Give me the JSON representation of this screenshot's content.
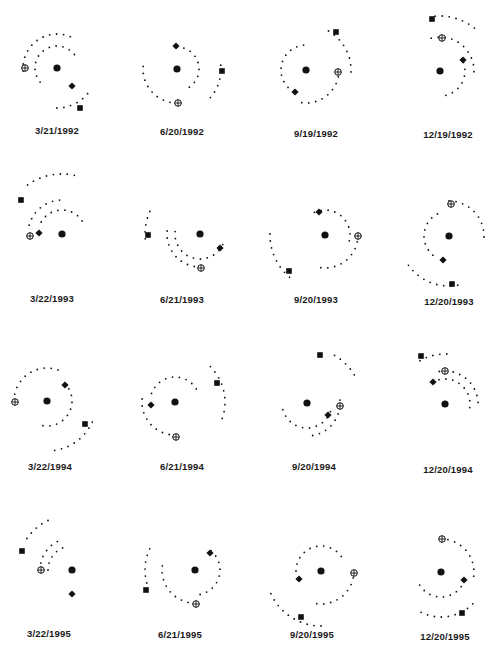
{
  "figure": {
    "type": "orbital-positions-grid",
    "rows": 4,
    "columns": 4,
    "colors": {
      "ink": "#111111",
      "background": "#ffffff"
    },
    "marker_legend": {
      "center": "filled-circle",
      "planet_a": "diamond",
      "planet_b": "circled-plus",
      "planet_c": "square"
    },
    "panels": [
      {
        "label": "3/21/1992",
        "label_pos": [
          57,
          131
        ],
        "center": [
          57,
          68
        ],
        "arcs": [
          {
            "cx": 57,
            "cy": 68,
            "r": 22,
            "a0": 140,
            "a1": 330
          },
          {
            "cx": 57,
            "cy": 68,
            "r": 34,
            "a0": 175,
            "a1": 300
          },
          {
            "cx": 57,
            "cy": 68,
            "r": 40,
            "a0": 40,
            "a1": 100
          }
        ],
        "markers": [
          {
            "type": "diamond",
            "x": 72,
            "y": 86
          },
          {
            "type": "circled-plus",
            "x": 25,
            "y": 68
          },
          {
            "type": "square",
            "x": 80,
            "y": 108
          }
        ]
      },
      {
        "label": "6/20/1992",
        "label_pos": [
          182,
          132
        ],
        "center": [
          177,
          69
        ],
        "arcs": [
          {
            "cx": 177,
            "cy": 69,
            "r": 22,
            "a0": -90,
            "a1": 60
          },
          {
            "cx": 177,
            "cy": 69,
            "r": 34,
            "a0": 90,
            "a1": 190
          },
          {
            "cx": 177,
            "cy": 69,
            "r": 44,
            "a0": -5,
            "a1": 45
          }
        ],
        "markers": [
          {
            "type": "diamond",
            "x": 176,
            "y": 46
          },
          {
            "type": "circled-plus",
            "x": 178,
            "y": 103
          },
          {
            "type": "square",
            "x": 222,
            "y": 71
          }
        ]
      },
      {
        "label": "9/19/1992",
        "label_pos": [
          316,
          134
        ],
        "center": [
          306,
          70
        ],
        "arcs": [
          {
            "cx": 306,
            "cy": 70,
            "r": 25,
            "a0": 120,
            "a1": 270
          },
          {
            "cx": 306,
            "cy": 70,
            "r": 33,
            "a0": 0,
            "a1": 105
          },
          {
            "cx": 306,
            "cy": 70,
            "r": 45,
            "a0": -60,
            "a1": 5
          }
        ],
        "markers": [
          {
            "type": "diamond",
            "x": 295,
            "y": 92
          },
          {
            "type": "circled-plus",
            "x": 338,
            "y": 72
          },
          {
            "type": "square",
            "x": 336,
            "y": 32
          }
        ]
      },
      {
        "label": "12/19/1992",
        "label_pos": [
          448,
          135
        ],
        "center": [
          440,
          71
        ],
        "arcs": [
          {
            "cx": 440,
            "cy": 71,
            "r": 25,
            "a0": -20,
            "a1": 90
          },
          {
            "cx": 440,
            "cy": 71,
            "r": 34,
            "a0": -105,
            "a1": 10
          },
          {
            "cx": 440,
            "cy": 71,
            "r": 55,
            "a0": -95,
            "a1": -45
          }
        ],
        "markers": [
          {
            "type": "diamond",
            "x": 463,
            "y": 60
          },
          {
            "type": "circled-plus",
            "x": 442,
            "y": 38
          },
          {
            "type": "square",
            "x": 432,
            "y": 19
          }
        ]
      },
      {
        "label": "3/22/1993",
        "label_pos": [
          52,
          299
        ],
        "center": [
          62,
          234
        ],
        "arcs": [
          {
            "cx": 62,
            "cy": 234,
            "r": 24,
            "a0": -150,
            "a1": -20
          },
          {
            "cx": 62,
            "cy": 234,
            "r": 34,
            "a0": -165,
            "a1": -85
          },
          {
            "cx": 62,
            "cy": 234,
            "r": 60,
            "a0": -125,
            "a1": -75
          }
        ],
        "markers": [
          {
            "type": "diamond",
            "x": 39,
            "y": 233
          },
          {
            "type": "circled-plus",
            "x": 30,
            "y": 236
          },
          {
            "type": "square",
            "x": 21,
            "y": 200
          }
        ]
      },
      {
        "label": "6/21/1993",
        "label_pos": [
          182,
          300
        ],
        "center": [
          200,
          234
        ],
        "arcs": [
          {
            "cx": 200,
            "cy": 234,
            "r": 25,
            "a0": 25,
            "a1": 195
          },
          {
            "cx": 200,
            "cy": 234,
            "r": 33,
            "a0": 88,
            "a1": 190
          },
          {
            "cx": 200,
            "cy": 234,
            "r": 55,
            "a0": -150,
            "a1": -185
          }
        ],
        "markers": [
          {
            "type": "diamond",
            "x": 220,
            "y": 248
          },
          {
            "type": "circled-plus",
            "x": 201,
            "y": 268
          },
          {
            "type": "square",
            "x": 148,
            "y": 235
          }
        ]
      },
      {
        "label": "9/20/1993",
        "label_pos": [
          316,
          300
        ],
        "center": [
          325,
          235
        ],
        "arcs": [
          {
            "cx": 325,
            "cy": 235,
            "r": 25,
            "a0": -115,
            "a1": 15
          },
          {
            "cx": 325,
            "cy": 235,
            "r": 33,
            "a0": 0,
            "a1": 105
          },
          {
            "cx": 325,
            "cy": 235,
            "r": 55,
            "a0": 130,
            "a1": 185
          }
        ],
        "markers": [
          {
            "type": "diamond",
            "x": 319,
            "y": 212
          },
          {
            "type": "circled-plus",
            "x": 358,
            "y": 236
          },
          {
            "type": "square",
            "x": 289,
            "y": 271
          }
        ]
      },
      {
        "label": "12/20/1993",
        "label_pos": [
          449,
          302
        ],
        "center": [
          449,
          236
        ],
        "arcs": [
          {
            "cx": 449,
            "cy": 236,
            "r": 25,
            "a0": 130,
            "a1": 250
          },
          {
            "cx": 449,
            "cy": 236,
            "r": 35,
            "a0": -90,
            "a1": 2
          },
          {
            "cx": 449,
            "cy": 236,
            "r": 50,
            "a0": 80,
            "a1": 150
          }
        ],
        "markers": [
          {
            "type": "diamond",
            "x": 443,
            "y": 260
          },
          {
            "type": "circled-plus",
            "x": 451,
            "y": 204
          },
          {
            "type": "square",
            "x": 452,
            "y": 284
          }
        ]
      },
      {
        "label": "3/22/1994",
        "label_pos": [
          50,
          467
        ],
        "center": [
          47,
          401
        ],
        "arcs": [
          {
            "cx": 47,
            "cy": 401,
            "r": 25,
            "a0": -45,
            "a1": 100
          },
          {
            "cx": 47,
            "cy": 401,
            "r": 33,
            "a0": -180,
            "a1": -70
          },
          {
            "cx": 47,
            "cy": 401,
            "r": 50,
            "a0": 25,
            "a1": 85
          }
        ],
        "markers": [
          {
            "type": "diamond",
            "x": 65,
            "y": 385
          },
          {
            "type": "circled-plus",
            "x": 15,
            "y": 402
          },
          {
            "type": "square",
            "x": 85,
            "y": 424
          }
        ]
      },
      {
        "label": "6/21/1994",
        "label_pos": [
          182,
          467
        ],
        "center": [
          175,
          402
        ],
        "arcs": [
          {
            "cx": 175,
            "cy": 402,
            "r": 25,
            "a0": -160,
            "a1": -20
          },
          {
            "cx": 175,
            "cy": 402,
            "r": 33,
            "a0": 88,
            "a1": 195
          },
          {
            "cx": 175,
            "cy": 402,
            "r": 50,
            "a0": -45,
            "a1": 20
          }
        ],
        "markers": [
          {
            "type": "diamond",
            "x": 151,
            "y": 405
          },
          {
            "type": "circled-plus",
            "x": 176,
            "y": 437
          },
          {
            "type": "square",
            "x": 217,
            "y": 383
          }
        ]
      },
      {
        "label": "9/20/1994",
        "label_pos": [
          314,
          467
        ],
        "center": [
          307,
          403
        ],
        "arcs": [
          {
            "cx": 307,
            "cy": 403,
            "r": 25,
            "a0": 20,
            "a1": 180
          },
          {
            "cx": 307,
            "cy": 403,
            "r": 33,
            "a0": -5,
            "a1": 90
          },
          {
            "cx": 307,
            "cy": 403,
            "r": 55,
            "a0": -60,
            "a1": -25
          }
        ],
        "markers": [
          {
            "type": "diamond",
            "x": 328,
            "y": 415
          },
          {
            "type": "circled-plus",
            "x": 340,
            "y": 406
          },
          {
            "type": "square",
            "x": 320,
            "y": 355
          }
        ]
      },
      {
        "label": "12/20/1994",
        "label_pos": [
          448,
          470
        ],
        "center": [
          445,
          404
        ],
        "arcs": [
          {
            "cx": 445,
            "cy": 404,
            "r": 25,
            "a0": -120,
            "a1": 15
          },
          {
            "cx": 445,
            "cy": 404,
            "r": 33,
            "a0": -100,
            "a1": 5
          },
          {
            "cx": 445,
            "cy": 404,
            "r": 50,
            "a0": -120,
            "a1": -80
          }
        ],
        "markers": [
          {
            "type": "diamond",
            "x": 433,
            "y": 382
          },
          {
            "type": "circled-plus",
            "x": 445,
            "y": 371
          },
          {
            "type": "square",
            "x": 421,
            "y": 356
          }
        ]
      },
      {
        "label": "3/22/1995",
        "label_pos": [
          49,
          634
        ],
        "center": [
          72,
          570
        ],
        "arcs": [
          {
            "cx": 72,
            "cy": 570,
            "r": 24,
            "a0": -100,
            "a1": -180
          },
          {
            "cx": 72,
            "cy": 570,
            "r": 32,
            "a0": -110,
            "a1": -180
          },
          {
            "cx": 72,
            "cy": 570,
            "r": 55,
            "a0": -145,
            "a1": -115
          }
        ],
        "markers": [
          {
            "type": "diamond",
            "x": 72,
            "y": 594
          },
          {
            "type": "circled-plus",
            "x": 41,
            "y": 570
          },
          {
            "type": "square",
            "x": 22,
            "y": 551
          }
        ]
      },
      {
        "label": "6/21/1995",
        "label_pos": [
          180,
          635
        ],
        "center": [
          195,
          570
        ],
        "arcs": [
          {
            "cx": 195,
            "cy": 570,
            "r": 25,
            "a0": -50,
            "a1": 90
          },
          {
            "cx": 195,
            "cy": 570,
            "r": 33,
            "a0": 90,
            "a1": 190
          },
          {
            "cx": 195,
            "cy": 570,
            "r": 50,
            "a0": 165,
            "a1": 210
          }
        ],
        "markers": [
          {
            "type": "diamond",
            "x": 210,
            "y": 553
          },
          {
            "type": "circled-plus",
            "x": 196,
            "y": 604
          },
          {
            "type": "square",
            "x": 146,
            "y": 590
          }
        ]
      },
      {
        "label": "9/20/1995",
        "label_pos": [
          312,
          635
        ],
        "center": [
          321,
          571
        ],
        "arcs": [
          {
            "cx": 321,
            "cy": 571,
            "r": 25,
            "a0": 180,
            "a1": 330
          },
          {
            "cx": 321,
            "cy": 571,
            "r": 33,
            "a0": 0,
            "a1": 100
          },
          {
            "cx": 321,
            "cy": 571,
            "r": 55,
            "a0": 90,
            "a1": 160
          }
        ],
        "markers": [
          {
            "type": "diamond",
            "x": 299,
            "y": 579
          },
          {
            "type": "circled-plus",
            "x": 354,
            "y": 573
          },
          {
            "type": "square",
            "x": 301,
            "y": 617
          }
        ]
      },
      {
        "label": "12/20/1995",
        "label_pos": [
          445,
          637
        ],
        "center": [
          441,
          572
        ],
        "arcs": [
          {
            "cx": 441,
            "cy": 572,
            "r": 25,
            "a0": 20,
            "a1": 160
          },
          {
            "cx": 441,
            "cy": 572,
            "r": 33,
            "a0": -90,
            "a1": 10
          },
          {
            "cx": 441,
            "cy": 572,
            "r": 45,
            "a0": 45,
            "a1": 125
          }
        ],
        "markers": [
          {
            "type": "diamond",
            "x": 464,
            "y": 580
          },
          {
            "type": "circled-plus",
            "x": 442,
            "y": 539
          },
          {
            "type": "square",
            "x": 462,
            "y": 613
          }
        ]
      }
    ]
  }
}
